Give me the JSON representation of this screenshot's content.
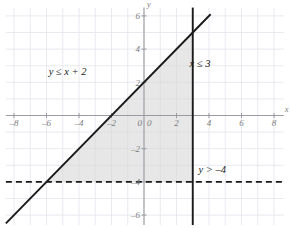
{
  "chart_data": {
    "type": "line",
    "title": "",
    "xlabel": "x",
    "ylabel": "y",
    "xlim": [
      -8.5,
      8.6
    ],
    "ylim": [
      -6.6,
      6.5
    ],
    "grid": true,
    "grid_step": 1,
    "legend": "none",
    "x_ticks": [
      "-8",
      "-6",
      "-4",
      "-2",
      "0",
      "2",
      "4",
      "6",
      "8"
    ],
    "x_tick_values": [
      -8,
      -6,
      -4,
      -2,
      0,
      2,
      4,
      6,
      8
    ],
    "y_ticks": [
      "6",
      "4",
      "2",
      "0",
      "-2",
      "-4",
      "-6"
    ],
    "y_tick_values": [
      6,
      4,
      2,
      0,
      -2,
      -4,
      -6
    ],
    "series": [
      {
        "name": "y <= x + 2",
        "type": "line",
        "style": "solid",
        "color": "#1a1a1a",
        "slope": 1,
        "intercept": 2,
        "x": [
          -8.5,
          4.1
        ],
        "y": [
          -6.5,
          6.1
        ],
        "label": "y ≤ x + 2",
        "label_x": -4.7,
        "label_y": 2.45
      },
      {
        "name": "x <= 3",
        "type": "vline",
        "style": "solid",
        "color": "#1a1a1a",
        "value": 3,
        "x": [
          3,
          3
        ],
        "y": [
          -6.6,
          6.5
        ],
        "label": "x ≤ 3",
        "label_x": 3.45,
        "label_y": 2.95
      },
      {
        "name": "y > -4",
        "type": "hline",
        "style": "dashed",
        "color": "#1a1a1a",
        "value": -4,
        "x": [
          -8.5,
          8.6
        ],
        "y": [
          -4,
          -4
        ],
        "label": "y > –4",
        "label_x": 4.2,
        "label_y": -3.45
      }
    ],
    "shaded_region": {
      "name": "solution-region",
      "fill": "#d9d9d9",
      "opacity": 0.62,
      "description": "Triangle bounded by y = x + 2, x = 3, y = -4",
      "vertices": [
        [
          -6,
          -4
        ],
        [
          3,
          -4
        ],
        [
          3,
          5
        ]
      ]
    },
    "annotations": [
      {
        "text": "y ≤ x + 2",
        "x": -4.7,
        "y": 2.45
      },
      {
        "text": "x ≤ 3",
        "x": 3.45,
        "y": 2.95
      },
      {
        "text": "y > –4",
        "x": 4.2,
        "y": -3.45
      }
    ],
    "colors": {
      "grid": "#e3e3ec",
      "axis": "#9a9aa2",
      "line": "#1a1a1a",
      "shade": "#d9d9d9",
      "tick_text": "#7d7d7d",
      "label_text": "#1a1a1a",
      "background": "#ffffff"
    }
  }
}
